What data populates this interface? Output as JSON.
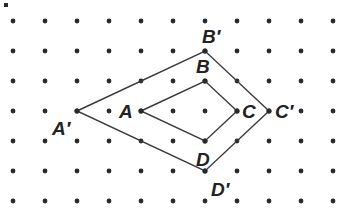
{
  "grid": {
    "cols": 11,
    "rows": 7,
    "origin_x": 13,
    "origin_y": 21,
    "step_x": 32,
    "step_y": 30,
    "dot_color": "#2a2a2a"
  },
  "corner_fragment": ".",
  "figures": [
    {
      "name": "original-quadrilateral",
      "vertices": [
        {
          "label": "A",
          "col": 4,
          "row": 3,
          "label_dx": -22,
          "label_dy": 7
        },
        {
          "label": "B",
          "col": 6,
          "row": 2,
          "label_dx": -9,
          "label_dy": -8
        },
        {
          "label": "C",
          "col": 7,
          "row": 3,
          "label_dx": 5,
          "label_dy": 7
        },
        {
          "label": "D",
          "col": 6,
          "row": 4,
          "label_dx": -9,
          "label_dy": 25
        }
      ]
    },
    {
      "name": "image-quadrilateral",
      "vertices": [
        {
          "label": "A′",
          "col": 2,
          "row": 3,
          "label_dx": -25,
          "label_dy": 24
        },
        {
          "label": "B′",
          "col": 6,
          "row": 1,
          "label_dx": -3,
          "label_dy": -8
        },
        {
          "label": "C′",
          "col": 8,
          "row": 3,
          "label_dx": 6,
          "label_dy": 7
        },
        {
          "label": "D′",
          "col": 6,
          "row": 5,
          "label_dx": 6,
          "label_dy": 25
        }
      ]
    }
  ],
  "colors": {
    "line": "#3a3a3a",
    "label": "#222222",
    "background": "#ffffff"
  }
}
